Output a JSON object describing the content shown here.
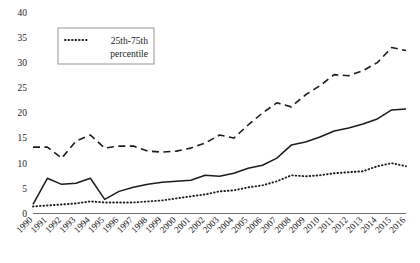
{
  "chart_data": {
    "type": "line",
    "title": "",
    "subtitle": "",
    "xlabel": "",
    "ylabel": "",
    "ylim": [
      0,
      40
    ],
    "yticks": [
      0,
      5,
      10,
      15,
      20,
      25,
      30,
      35,
      40
    ],
    "ytick_labels": [
      "0",
      "5",
      "10",
      "15",
      "20",
      "25",
      "30",
      "35",
      "40"
    ],
    "grid": false,
    "legend_position": "top-left",
    "legend_entries": [
      {
        "label_line1": "25th-75th",
        "label_line2": "percentile",
        "style": "dotted"
      }
    ],
    "categories": [
      "1990",
      "1991",
      "1992",
      "1993",
      "1994",
      "1995",
      "1996",
      "1997",
      "1998",
      "1999",
      "2000",
      "2001",
      "2002",
      "2003",
      "2004",
      "2005",
      "2006",
      "2007",
      "2008",
      "2009",
      "2010",
      "2011",
      "2012",
      "2013",
      "2014",
      "2015",
      "2016"
    ],
    "series": [
      {
        "name": "75th percentile",
        "style": "dashed",
        "values": [
          13.2,
          13.2,
          11.0,
          14.4,
          15.6,
          13.0,
          13.4,
          13.4,
          12.4,
          12.2,
          12.4,
          13.0,
          14.0,
          15.6,
          15.0,
          17.6,
          20.0,
          22.0,
          21.2,
          23.6,
          25.4,
          27.6,
          27.4,
          28.4,
          30.0,
          33.0,
          32.4
        ]
      },
      {
        "name": "median",
        "style": "solid",
        "values": [
          1.8,
          7.0,
          5.8,
          6.0,
          7.0,
          2.8,
          4.4,
          5.2,
          5.8,
          6.2,
          6.4,
          6.6,
          7.6,
          7.4,
          8.0,
          9.0,
          9.6,
          11.0,
          13.6,
          14.2,
          15.2,
          16.4,
          17.0,
          17.8,
          18.8,
          20.6,
          20.8
        ]
      },
      {
        "name": "25th percentile",
        "style": "dotted",
        "values": [
          1.4,
          1.6,
          1.8,
          2.0,
          2.4,
          2.2,
          2.2,
          2.2,
          2.4,
          2.6,
          3.0,
          3.4,
          3.8,
          4.4,
          4.6,
          5.2,
          5.6,
          6.4,
          7.6,
          7.4,
          7.6,
          8.0,
          8.2,
          8.4,
          9.4,
          10.0,
          9.4
        ]
      }
    ]
  }
}
